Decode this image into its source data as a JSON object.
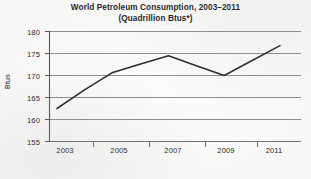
{
  "chart_data": {
    "type": "line",
    "title": "World Petroleum Consumption, 2003–2011",
    "subtitle": "(Quadrillion Btus*)",
    "xlabel": "",
    "ylabel": "Btus",
    "categories": [
      "2003",
      "2004",
      "2005",
      "2006",
      "2007",
      "2008",
      "2009",
      "2010",
      "2011"
    ],
    "x_tick_labels": [
      "2003",
      "2005",
      "2007",
      "2009",
      "2011"
    ],
    "values": [
      162.5,
      166.8,
      170.7,
      172.6,
      174.5,
      172.2,
      170.0,
      173.4,
      176.8
    ],
    "ylim": [
      155,
      180
    ],
    "y_tick_labels": [
      "180",
      "175",
      "170",
      "165",
      "160",
      "155"
    ],
    "y_ticks": [
      180,
      175,
      170,
      165,
      160,
      155
    ],
    "grid": "horizontal",
    "legend": "none",
    "series_color": "#2b2b2b"
  },
  "colors": {
    "background": "#fbfbfa",
    "gridline": "#8e8e8e",
    "axis": "#6e6e6e",
    "text": "#1d1d1d",
    "line": "#2b2b2b"
  }
}
